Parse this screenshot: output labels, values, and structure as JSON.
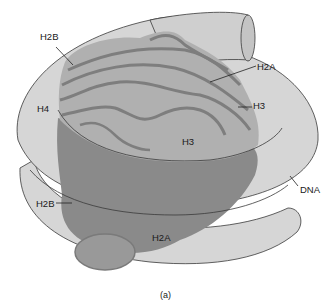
{
  "diagram": {
    "caption": "(a)",
    "colors": {
      "dna_fill": "#d6d6d6",
      "dna_stroke": "#3a3a3a",
      "histone_light": "#b4b4b4",
      "histone_mid": "#9c9c9c",
      "histone_dark": "#8a8a8a",
      "histone_ridge": "#7e7e7e",
      "background": "#ffffff"
    },
    "labels": [
      {
        "id": "h2b-top",
        "text": "H2B",
        "x": 40,
        "y": 32
      },
      {
        "id": "h2a-top",
        "text": "H2A",
        "x": 257,
        "y": 62
      },
      {
        "id": "h4",
        "text": "H4",
        "x": 37,
        "y": 104
      },
      {
        "id": "h3-right",
        "text": "H3",
        "x": 253,
        "y": 101
      },
      {
        "id": "h3-center",
        "text": "H3",
        "x": 182,
        "y": 137
      },
      {
        "id": "dna",
        "text": "DNA",
        "x": 300,
        "y": 185
      },
      {
        "id": "h2b-bottom",
        "text": "H2B",
        "x": 36,
        "y": 199
      },
      {
        "id": "h2a-bottom",
        "text": "H2A",
        "x": 152,
        "y": 233
      }
    ]
  }
}
